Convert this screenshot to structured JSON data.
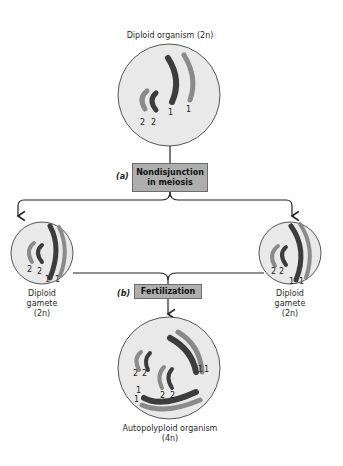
{
  "diagram": {
    "type": "autopolyploidy-formation",
    "colors": {
      "cell_fill": "#e9e9e9",
      "cell_stroke": "#555555",
      "chromosome_dark": "#3c3c3c",
      "chromosome_light": "#8a8a8a",
      "box_fill": "#aeaeae",
      "arrow": "#222222"
    },
    "top_cell": {
      "title": "Diploid organism",
      "ploidy": "(2n)",
      "chromosome_labels": [
        "2",
        "2",
        "1",
        "1"
      ]
    },
    "step_a": {
      "letter": "(a)",
      "line1": "Nondisjunction",
      "line2": "in meiosis"
    },
    "left_gamete": {
      "line1": "Diploid",
      "line2": "gamete",
      "ploidy": "(2n)",
      "chromosome_labels": [
        "2",
        "2",
        "1",
        "1"
      ]
    },
    "right_gamete": {
      "line1": "Diploid",
      "line2": "gamete",
      "ploidy": "(2n)",
      "chromosome_labels": [
        "2",
        "2",
        "1",
        "1"
      ]
    },
    "step_b": {
      "letter": "(b)",
      "label": "Fertilization"
    },
    "bottom_cell": {
      "title": "Autopolyploid organism",
      "ploidy": "(4n)",
      "chromosome_labels": [
        "2",
        "2",
        "2",
        "2",
        "1",
        "1",
        "1",
        "1"
      ]
    }
  }
}
